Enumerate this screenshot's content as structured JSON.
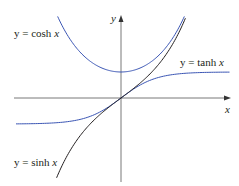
{
  "chart_data": {
    "type": "line",
    "title": "",
    "xlabel": "x",
    "ylabel": "y",
    "xlim": [
      -3.0,
      3.1
    ],
    "ylim": [
      -3.4,
      3.7
    ],
    "grid": false,
    "legend": "inline labels",
    "series": [
      {
        "name": "y = cosh x",
        "function": "cosh",
        "color": "#3a55b4",
        "x_range": [
          -1.81,
          1.81
        ]
      },
      {
        "name": "y = tanh x",
        "function": "tanh",
        "color": "#3a55b4",
        "x_range": [
          -3.0,
          3.1
        ]
      },
      {
        "name": "y = sinh x",
        "function": "sinh",
        "color": "#231f20",
        "x_range": [
          -1.84,
          1.84
        ]
      }
    ],
    "annotations": [
      {
        "text": "y = cosh x",
        "near": "upper-left"
      },
      {
        "text": "y = tanh x",
        "near": "right, above asymptote y=1"
      },
      {
        "text": "y = sinh x",
        "near": "lower-left"
      }
    ]
  },
  "labels": {
    "y_axis": "y",
    "x_axis": "x",
    "cosh": {
      "prefix": "y = cosh ",
      "var": "x"
    },
    "tanh": {
      "prefix": "y = tanh ",
      "var": "x"
    },
    "sinh": {
      "prefix": "y = sinh ",
      "var": "x"
    }
  },
  "colors": {
    "blue": "#3a55b4",
    "black": "#231f20",
    "axis": "#555555"
  }
}
